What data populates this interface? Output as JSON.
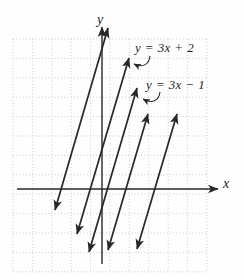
{
  "figure": {
    "y_axis_label": "y",
    "x_axis_label": "x",
    "equation_label_1": "y = 3x + 2",
    "equation_label_2": "y = 3x − 1"
  },
  "colors": {
    "ink": "#272727",
    "grid": "#c9cdd6",
    "background": "#fefefe"
  },
  "chart_data": {
    "type": "line",
    "title": "",
    "xlabel": "x",
    "ylabel": "y",
    "grid": true,
    "grid_style": "dotted square cells, 1 unit per cell",
    "legend": "none",
    "xlim": [
      -4.5,
      5.5
    ],
    "ylim": [
      -4.5,
      7.5
    ],
    "series": [
      {
        "name": "unlabeled line (leftmost)",
        "slope": 3,
        "y_intercept_est": 6.5,
        "px": {
          "x1": 55,
          "y1": 210,
          "x2": 108,
          "y2": 28
        }
      },
      {
        "name": "y = 3x + 2",
        "slope": 3,
        "y_intercept": 2,
        "px": {
          "x1": 77,
          "y1": 234,
          "x2": 129,
          "y2": 58
        }
      },
      {
        "name": "y = 3x − 1",
        "slope": 3,
        "y_intercept": -1,
        "px": {
          "x1": 89,
          "y1": 252,
          "x2": 137,
          "y2": 88
        }
      },
      {
        "name": "unlabeled line",
        "slope": 3,
        "y_intercept_est": -3.5,
        "px": {
          "x1": 108,
          "y1": 250,
          "x2": 148,
          "y2": 114
        }
      },
      {
        "name": "unlabeled line (rightmost)",
        "slope": 3,
        "y_intercept_est": -8,
        "px": {
          "x1": 137,
          "y1": 249,
          "x2": 177,
          "y2": 114
        }
      }
    ],
    "axes_px": {
      "x_axis": {
        "x1": 17,
        "y1": 189,
        "x2": 218,
        "y2": 189
      },
      "y_axis": {
        "x1": 102,
        "y1": 264,
        "x2": 102,
        "y2": 27
      }
    },
    "grid_px": {
      "left": 13,
      "top": 39,
      "right": 207,
      "bottom": 272,
      "step": 19.4
    },
    "annotations": [
      {
        "text": "y = 3x + 2",
        "text_x": 135,
        "text_y": 52,
        "hook_path": "M150,56 C149,65 142,68 134,64"
      },
      {
        "text": "y = 3x − 1",
        "text_x": 146,
        "text_y": 89,
        "hook_path": "M160,92 C159,101 152,104 143,99"
      }
    ]
  }
}
